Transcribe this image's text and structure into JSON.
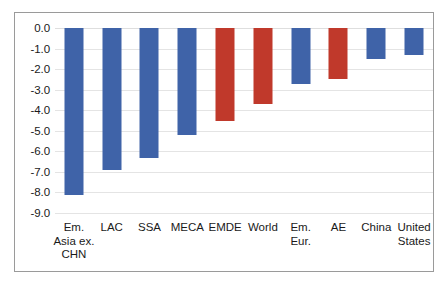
{
  "chart_data": {
    "type": "bar",
    "title": "",
    "subtitle": "",
    "xlabel": "",
    "ylabel": "",
    "ylim": [
      -9.0,
      0.0
    ],
    "grid": true,
    "legend": "none",
    "orientation": "vertical",
    "categories": [
      "Em. Asia ex. CHN",
      "LAC",
      "SSA",
      "MECA",
      "EMDE",
      "World",
      "Em. Eur.",
      "AE",
      "China",
      "United States"
    ],
    "category_lines": [
      [
        "Em.",
        "Asia ex.",
        "CHN"
      ],
      [
        "LAC"
      ],
      [
        "SSA"
      ],
      [
        "MECA"
      ],
      [
        "EMDE"
      ],
      [
        "World"
      ],
      [
        "Em.",
        "Eur."
      ],
      [
        "AE"
      ],
      [
        "China"
      ],
      [
        "United",
        "States"
      ]
    ],
    "values": [
      -8.1,
      -6.9,
      -6.3,
      -5.2,
      -4.5,
      -3.7,
      -2.7,
      -2.5,
      -1.5,
      -1.3
    ],
    "bar_colors": [
      "#3F63A8",
      "#3F63A8",
      "#3F63A8",
      "#3F63A8",
      "#C0392B",
      "#C0392B",
      "#3F63A8",
      "#C0392B",
      "#3F63A8",
      "#3F63A8"
    ],
    "ytick_labels": [
      "0.0",
      "-1.0",
      "-2.0",
      "-3.0",
      "-4.0",
      "-5.0",
      "-6.0",
      "-7.0",
      "-8.0",
      "-9.0"
    ],
    "ytick_values": [
      0.0,
      -1.0,
      -2.0,
      -3.0,
      -4.0,
      -5.0,
      -6.0,
      -7.0,
      -8.0,
      -9.0
    ],
    "colors": {
      "series_blue": "#3F63A8",
      "series_red": "#C0392B",
      "gridline": "#e4e4e4",
      "frame": "#9a9a9a",
      "text": "#1a1a1a",
      "background": "#ffffff"
    }
  }
}
